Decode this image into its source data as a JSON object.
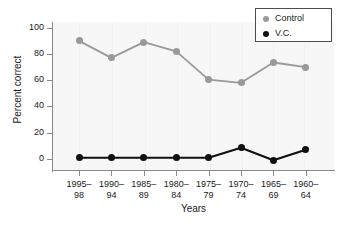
{
  "chart_data": {
    "type": "line",
    "title": "",
    "xlabel": "Years",
    "ylabel": "Percent correct",
    "ylim": [
      0,
      100
    ],
    "yticks": [
      0,
      20,
      40,
      60,
      80,
      100
    ],
    "grid": "vertical-faint",
    "legend_position": "top-right",
    "categories": [
      "1995–98",
      "1990–94",
      "1985–89",
      "1980–84",
      "1975–79",
      "1970–74",
      "1965–69",
      "1960–64"
    ],
    "category_lines": [
      [
        "1995–",
        "98"
      ],
      [
        "1990–",
        "94"
      ],
      [
        "1985–",
        "89"
      ],
      [
        "1980–",
        "84"
      ],
      [
        "1975–",
        "79"
      ],
      [
        "1970–",
        "74"
      ],
      [
        "1965–",
        "69"
      ],
      [
        "1960–",
        "64"
      ]
    ],
    "series": [
      {
        "name": "Control",
        "color": "#999999",
        "values": [
          90,
          77,
          89,
          82,
          60.5,
          58,
          73.5,
          70
        ]
      },
      {
        "name": "V.C.",
        "color": "#101010",
        "values": [
          1,
          1,
          1,
          1,
          1,
          8.5,
          -1,
          7
        ]
      }
    ]
  },
  "axis": {
    "y_title": "Percent correct",
    "x_title": "Years",
    "ytick_labels": [
      "100",
      "80",
      "60",
      "40",
      "20",
      "0"
    ]
  },
  "legend": {
    "items": [
      {
        "label": "Control",
        "marker": "filled-circle-gray"
      },
      {
        "label": "V.C.",
        "marker": "filled-circle-black"
      }
    ]
  }
}
